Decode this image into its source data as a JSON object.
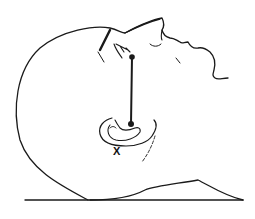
{
  "figure": {
    "colors": {
      "background": "#ffffff",
      "ink": "#1a1a1a"
    },
    "landmarks": [
      {
        "name": "eye-point",
        "x": 132,
        "y": 57
      },
      {
        "name": "ear-point",
        "x": 131,
        "y": 124
      }
    ],
    "marker": {
      "label": "X",
      "x": 116,
      "y": 149
    }
  }
}
